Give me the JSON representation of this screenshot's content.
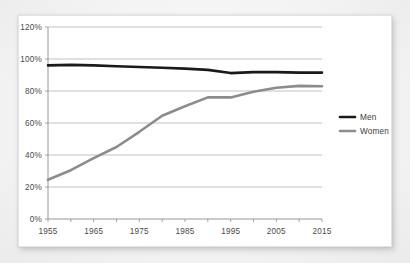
{
  "chart_data": {
    "type": "line",
    "title": "",
    "subtitle": "",
    "xlabel": "",
    "ylabel": "",
    "xlim": [
      1955,
      2015
    ],
    "ylim": [
      0,
      120
    ],
    "grid": true,
    "legend_position": "right",
    "y_ticks": [
      "0%",
      "20%",
      "40%",
      "60%",
      "80%",
      "100%",
      "120%"
    ],
    "y_tick_values": [
      0,
      20,
      40,
      60,
      80,
      100,
      120
    ],
    "x_ticks": [
      "1955",
      "1965",
      "1975",
      "1985",
      "1995",
      "2005",
      "2015"
    ],
    "x_tick_values": [
      1955,
      1965,
      1975,
      1985,
      1995,
      2005,
      2015
    ],
    "x_minor_tick_values": [
      1955,
      1960,
      1965,
      1970,
      1975,
      1980,
      1985,
      1990,
      1995,
      2000,
      2005,
      2010,
      2015
    ],
    "x": [
      1955,
      1960,
      1965,
      1970,
      1975,
      1980,
      1985,
      1990,
      1995,
      2000,
      2005,
      2010,
      2015
    ],
    "series": [
      {
        "name": "Men",
        "color": "#1a1a1a",
        "values": [
          96.0,
          96.3,
          96.0,
          95.5,
          95.0,
          94.5,
          94.0,
          93.2,
          91.2,
          91.8,
          91.8,
          91.5,
          91.5
        ]
      },
      {
        "name": "Women",
        "color": "#8c8c8c",
        "values": [
          24.5,
          30.5,
          38.0,
          45.0,
          54.5,
          64.5,
          70.5,
          76.0,
          76.0,
          79.5,
          82.0,
          83.2,
          83.0
        ]
      }
    ]
  },
  "legend": {
    "items": [
      {
        "label": "Men",
        "color": "#1a1a1a"
      },
      {
        "label": "Women",
        "color": "#8c8c8c"
      }
    ]
  },
  "colors": {
    "men": "#1a1a1a",
    "women": "#8c8c8c",
    "gridline": "#a8a8a8",
    "axis": "#8d8d8d",
    "text": "#4a4a4a",
    "card_background": "#ffffff",
    "page_background": "#f2f2f2"
  }
}
